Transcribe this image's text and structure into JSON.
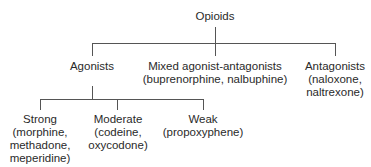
{
  "diagram": {
    "root": {
      "label": "Opioids"
    },
    "level1": [
      {
        "label": "Agonists",
        "detail": []
      },
      {
        "label": "Mixed agonist-antagonists",
        "detail": [
          "(buprenorphine, nalbuphine)"
        ]
      },
      {
        "label": "Antagonists",
        "detail": [
          "(naloxone,",
          "naltrexone)"
        ]
      }
    ],
    "level2": [
      {
        "label": "Strong",
        "detail": [
          "(morphine,",
          "methadone,",
          "meperidine)"
        ]
      },
      {
        "label": "Moderate",
        "detail": [
          "(codeine,",
          "oxycodone)"
        ]
      },
      {
        "label": "Weak",
        "detail": [
          "(propoxyphene)"
        ]
      }
    ]
  }
}
